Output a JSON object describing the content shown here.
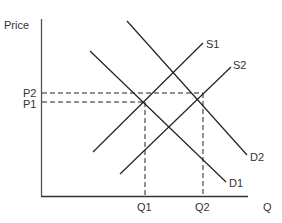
{
  "diagram": {
    "type": "supply-demand",
    "axes": {
      "y_label": "Price",
      "x_label": "Q"
    },
    "price_labels": {
      "p2": "P2",
      "p1": "P1"
    },
    "quantity_labels": {
      "q1": "Q1",
      "q2": "Q2"
    },
    "curves": {
      "s1": "S1",
      "s2": "S2",
      "d1": "D1",
      "d2": "D2"
    },
    "colors": {
      "line": "#222222",
      "axis": "#444444",
      "text": "#333333"
    }
  }
}
